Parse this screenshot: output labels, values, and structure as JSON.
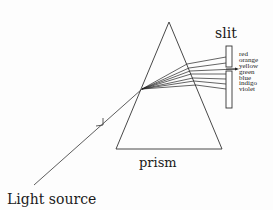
{
  "diagram": {
    "labels": {
      "slit": "slit",
      "prism": "prism",
      "light_source": "Light source"
    },
    "spectrum_colors": [
      "red",
      "orange",
      "yellow",
      "green",
      "blue",
      "indigo",
      "violet"
    ],
    "selected_color": "yellow",
    "line_color": "#222222"
  }
}
